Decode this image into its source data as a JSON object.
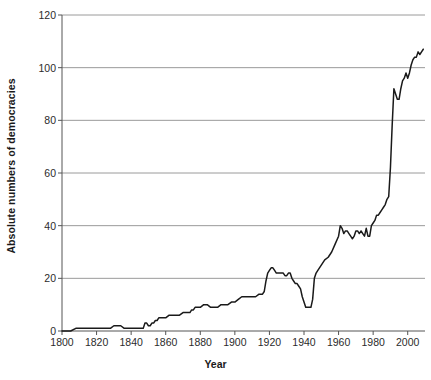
{
  "chart_data": {
    "type": "line",
    "title": "",
    "xlabel": "Year",
    "ylabel": "Absolute numbers of democracies",
    "xlim": [
      1800,
      2010
    ],
    "ylim": [
      0,
      120
    ],
    "xticks": [
      1800,
      1820,
      1840,
      1860,
      1880,
      1900,
      1920,
      1940,
      1960,
      1980,
      2000
    ],
    "yticks": [
      0,
      20,
      40,
      60,
      80,
      100,
      120
    ],
    "grid": "horizontal",
    "legend": "none",
    "line_color": "#1a1a1a",
    "gridline_color": "#9a9a9a",
    "axis_color": "#555555",
    "series": [
      {
        "name": "Absolute numbers of democracies",
        "x": [
          1800,
          1805,
          1808,
          1810,
          1815,
          1820,
          1825,
          1828,
          1830,
          1832,
          1834,
          1836,
          1838,
          1840,
          1842,
          1844,
          1846,
          1847,
          1848,
          1849,
          1850,
          1851,
          1852,
          1853,
          1854,
          1855,
          1856,
          1857,
          1858,
          1860,
          1862,
          1864,
          1866,
          1868,
          1870,
          1872,
          1874,
          1875,
          1876,
          1877,
          1878,
          1880,
          1882,
          1884,
          1886,
          1888,
          1890,
          1892,
          1894,
          1896,
          1898,
          1900,
          1902,
          1904,
          1906,
          1908,
          1910,
          1912,
          1914,
          1916,
          1917,
          1918,
          1919,
          1920,
          1921,
          1922,
          1923,
          1924,
          1925,
          1926,
          1927,
          1928,
          1929,
          1930,
          1931,
          1932,
          1933,
          1934,
          1935,
          1936,
          1937,
          1938,
          1939,
          1940,
          1941,
          1942,
          1943,
          1944,
          1945,
          1946,
          1947,
          1948,
          1950,
          1952,
          1954,
          1956,
          1958,
          1960,
          1961,
          1962,
          1963,
          1964,
          1965,
          1966,
          1967,
          1968,
          1969,
          1970,
          1971,
          1972,
          1973,
          1974,
          1975,
          1976,
          1977,
          1978,
          1979,
          1980,
          1981,
          1982,
          1983,
          1984,
          1985,
          1986,
          1987,
          1988,
          1989,
          1990,
          1991,
          1992,
          1993,
          1994,
          1995,
          1996,
          1997,
          1998,
          1999,
          2000,
          2001,
          2002,
          2003,
          2004,
          2005,
          2006,
          2007,
          2008,
          2009
        ],
        "y": [
          0,
          0,
          1,
          1,
          1,
          1,
          1,
          1,
          2,
          2,
          2,
          1,
          1,
          1,
          1,
          1,
          1,
          1,
          3,
          3,
          2,
          2,
          3,
          3,
          4,
          4,
          5,
          5,
          5,
          5,
          6,
          6,
          6,
          6,
          7,
          7,
          7,
          8,
          8,
          9,
          9,
          9,
          10,
          10,
          9,
          9,
          9,
          10,
          10,
          10,
          11,
          11,
          12,
          13,
          13,
          13,
          13,
          13,
          14,
          14,
          15,
          19,
          22,
          23,
          24,
          24,
          23,
          22,
          22,
          22,
          22,
          22,
          21,
          21,
          22,
          22,
          20,
          19,
          18,
          18,
          17,
          16,
          13,
          11,
          9,
          9,
          9,
          9,
          12,
          20,
          22,
          23,
          25,
          27,
          28,
          30,
          33,
          36,
          40,
          39,
          37,
          38,
          38,
          37,
          36,
          35,
          36,
          38,
          38,
          37,
          38,
          37,
          36,
          39,
          36,
          36,
          40,
          41,
          42,
          44,
          44,
          45,
          46,
          47,
          48,
          50,
          51,
          62,
          78,
          92,
          90,
          88,
          88,
          92,
          95,
          96,
          98,
          96,
          98,
          101,
          103,
          104,
          104,
          106,
          105,
          106,
          107
        ]
      }
    ]
  },
  "axis": {
    "ytick_labels": [
      "0",
      "20",
      "40",
      "60",
      "80",
      "100",
      "120"
    ],
    "xtick_labels": [
      "1800",
      "1820",
      "1840",
      "1860",
      "1880",
      "1900",
      "1920",
      "1940",
      "1960",
      "1980",
      "2000"
    ],
    "xlabel_text": "Year",
    "ylabel_text": "Absolute numbers of democracies"
  }
}
